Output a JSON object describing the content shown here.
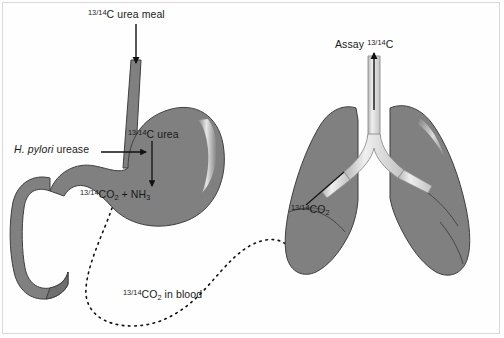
{
  "diagram": {
    "background_color": "#fefefe",
    "organ_fill": "#808080",
    "organ_stroke": "#3c3c3c",
    "airway_fill": "#dcdcdc",
    "line_color": "#111111"
  },
  "labels": {
    "urea_meal": {
      "isotope": "13/14",
      "text": "C urea meal"
    },
    "hp_urease": {
      "species": "H. pylori",
      "text": "urease"
    },
    "c_urea": {
      "isotope": "13/14",
      "text": "C urea"
    },
    "co2_nh3": {
      "isotope": "13/14",
      "co2": "CO",
      "co2_sub": "2",
      "plus": " + NH",
      "nh3_sub": "3"
    },
    "co2_blood": {
      "isotope": "13/14",
      "co2": "CO",
      "co2_sub": "2",
      "text": " in blood"
    },
    "co2_lung": {
      "isotope": "13/14",
      "co2": "CO",
      "co2_sub": "2"
    },
    "assay": {
      "text": "Assay ",
      "isotope": "13/14",
      "element": "C"
    }
  },
  "structures": {
    "esophagus": "esophagus",
    "stomach": "stomach",
    "duodenum": "duodenum",
    "left_lung": "left-lung",
    "right_lung": "right-lung",
    "trachea": "trachea",
    "bronchi": "bronchi"
  },
  "flows": {
    "ingestion_arrow": "urea meal swallowed into stomach",
    "urease_arrow": "H. pylori urease acts on labelled urea",
    "reaction_arrow": "urea converted to CO2 + NH3",
    "blood_path": "labelled CO2 carried in blood from stomach to lung",
    "exhalation_arrow": "labelled CO2 exhaled and assayed"
  }
}
